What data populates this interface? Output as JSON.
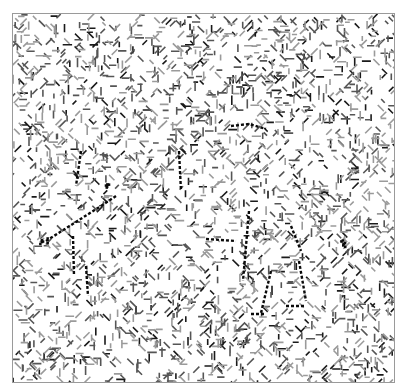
{
  "image": {
    "description": "Noise-pattern image (CAPTCHA-like) with faint hidden dotted strokes",
    "caption": "",
    "colors": {
      "background": "#ffffff",
      "border": "#9a9a9a",
      "noise_dark": "#1a1a1a",
      "noise_mid": "#555555",
      "noise_light": "#9a9a9a",
      "stroke": "#0a0a0a"
    },
    "noise": {
      "seed": 1337,
      "count": 2600
    },
    "hidden_strokes": [
      [
        [
          80,
          150
        ],
        [
          75,
          185
        ]
      ],
      [
        [
          45,
          240
        ],
        [
          100,
          205
        ]
      ],
      [
        [
          100,
          205
        ],
        [
          115,
          195
        ]
      ],
      [
        [
          72,
          235
        ],
        [
          73,
          275
        ]
      ],
      [
        [
          85,
          265
        ],
        [
          87,
          295
        ]
      ],
      [
        [
          230,
          125
        ],
        [
          248,
          123
        ],
        [
          265,
          128
        ]
      ],
      [
        [
          178,
          150
        ],
        [
          180,
          190
        ]
      ],
      [
        [
          205,
          238
        ],
        [
          235,
          240
        ]
      ],
      [
        [
          248,
          210
        ],
        [
          242,
          280
        ]
      ],
      [
        [
          270,
          270
        ],
        [
          260,
          312
        ]
      ],
      [
        [
          250,
          313
        ],
        [
          265,
          313
        ]
      ],
      [
        [
          298,
          260
        ],
        [
          305,
          300
        ]
      ],
      [
        [
          285,
          305
        ],
        [
          305,
          305
        ]
      ],
      [
        [
          290,
          225
        ],
        [
          300,
          250
        ]
      ]
    ],
    "clusters": [
      [
        42,
        240
      ],
      [
        340,
        242
      ],
      [
        105,
        185
      ]
    ]
  }
}
